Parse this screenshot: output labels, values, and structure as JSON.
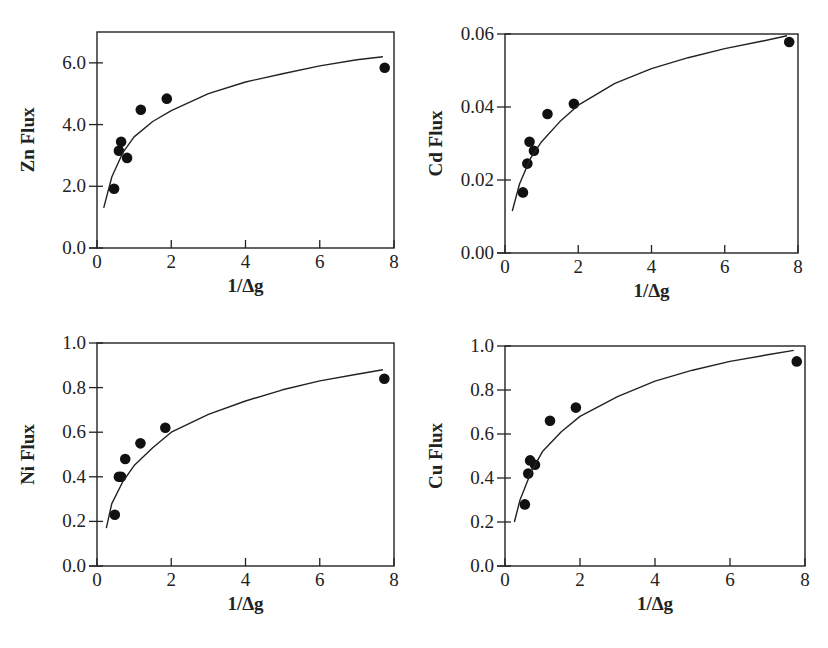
{
  "chart_data": [
    {
      "type": "scatter",
      "panel": "top-left",
      "title": "",
      "xlabel": "1/Δg",
      "ylabel": "Zn  Flux",
      "xlim": [
        0,
        8
      ],
      "ylim": [
        0,
        7
      ],
      "x_ticks": [
        "0",
        "2",
        "4",
        "6",
        "8"
      ],
      "y_ticks": [
        "0.0",
        "2.0",
        "4.0",
        "6.0"
      ],
      "grid": false,
      "legend": null,
      "series": [
        {
          "name": "observed",
          "kind": "points",
          "x": [
            0.46,
            0.59,
            0.65,
            0.81,
            1.18,
            1.88,
            7.75
          ],
          "y": [
            1.92,
            3.15,
            3.44,
            2.92,
            4.48,
            4.84,
            5.84
          ]
        },
        {
          "name": "fit",
          "kind": "line",
          "x": [
            0.18,
            0.4,
            0.7,
            1.0,
            1.5,
            2.0,
            3.0,
            4.0,
            5.0,
            6.0,
            7.0,
            7.7
          ],
          "y": [
            1.3,
            2.3,
            3.1,
            3.6,
            4.1,
            4.45,
            5.0,
            5.38,
            5.65,
            5.9,
            6.1,
            6.2
          ]
        }
      ]
    },
    {
      "type": "scatter",
      "panel": "top-right",
      "title": "",
      "xlabel": "1/Δg",
      "ylabel": "Cd Flux",
      "xlim": [
        0,
        8
      ],
      "ylim": [
        0,
        0.06
      ],
      "x_ticks": [
        "0",
        "2",
        "4",
        "6",
        "8"
      ],
      "y_ticks": [
        "0.00",
        "0.02",
        "0.04",
        "0.06"
      ],
      "grid": false,
      "legend": null,
      "series": [
        {
          "name": "observed",
          "kind": "points",
          "x": [
            0.49,
            0.61,
            0.67,
            0.79,
            1.16,
            1.88,
            7.76
          ],
          "y": [
            0.0166,
            0.0245,
            0.0305,
            0.028,
            0.0381,
            0.0409,
            0.0578
          ]
        },
        {
          "name": "fit",
          "kind": "line",
          "x": [
            0.2,
            0.4,
            0.7,
            1.0,
            1.5,
            2.0,
            3.0,
            4.0,
            5.0,
            6.0,
            7.0,
            7.7
          ],
          "y": [
            0.0115,
            0.019,
            0.026,
            0.0305,
            0.036,
            0.0405,
            0.0465,
            0.0505,
            0.0535,
            0.056,
            0.058,
            0.0595
          ]
        }
      ]
    },
    {
      "type": "scatter",
      "panel": "bottom-left",
      "title": "",
      "xlabel": "1/Δg",
      "ylabel": "Ni Flux",
      "xlim": [
        0,
        8
      ],
      "ylim": [
        0,
        1.0
      ],
      "x_ticks": [
        "0",
        "2",
        "4",
        "6",
        "8"
      ],
      "y_ticks": [
        "0.0",
        "0.2",
        "0.4",
        "0.6",
        "0.8",
        "1.0"
      ],
      "grid": false,
      "legend": null,
      "series": [
        {
          "name": "observed",
          "kind": "points",
          "x": [
            0.48,
            0.59,
            0.65,
            0.76,
            1.17,
            1.84,
            7.74
          ],
          "y": [
            0.23,
            0.4,
            0.4,
            0.48,
            0.55,
            0.62,
            0.84
          ]
        },
        {
          "name": "fit",
          "kind": "line",
          "x": [
            0.25,
            0.4,
            0.7,
            1.0,
            1.5,
            2.0,
            3.0,
            4.0,
            5.0,
            6.0,
            7.0,
            7.7
          ],
          "y": [
            0.17,
            0.28,
            0.38,
            0.45,
            0.53,
            0.6,
            0.68,
            0.74,
            0.79,
            0.83,
            0.86,
            0.88
          ]
        }
      ]
    },
    {
      "type": "scatter",
      "panel": "bottom-right",
      "title": "",
      "xlabel": "1/Δg",
      "ylabel": "Cu Flux",
      "xlim": [
        0,
        8
      ],
      "ylim": [
        0,
        1.0
      ],
      "x_ticks": [
        "0",
        "2",
        "4",
        "6",
        "8"
      ],
      "y_ticks": [
        "0.0",
        "0.2",
        "0.4",
        "0.6",
        "0.8",
        "1.0"
      ],
      "grid": false,
      "legend": null,
      "series": [
        {
          "name": "observed",
          "kind": "points",
          "x": [
            0.53,
            0.62,
            0.67,
            0.8,
            1.2,
            1.89,
            7.78
          ],
          "y": [
            0.28,
            0.42,
            0.48,
            0.46,
            0.66,
            0.72,
            0.93
          ]
        },
        {
          "name": "fit",
          "kind": "line",
          "x": [
            0.25,
            0.4,
            0.7,
            1.0,
            1.5,
            2.0,
            3.0,
            4.0,
            5.0,
            6.0,
            7.0,
            7.7
          ],
          "y": [
            0.2,
            0.3,
            0.43,
            0.52,
            0.61,
            0.68,
            0.77,
            0.84,
            0.89,
            0.93,
            0.96,
            0.98
          ]
        }
      ]
    }
  ],
  "panels": [
    {
      "id": "zn",
      "box": {
        "x0": 97,
        "y0": 32,
        "x1": 394,
        "y1": 248
      }
    },
    {
      "id": "cd",
      "box": {
        "x0": 505,
        "y0": 34,
        "x1": 798,
        "y1": 253
      }
    },
    {
      "id": "ni",
      "box": {
        "x0": 97,
        "y0": 343,
        "x1": 394,
        "y1": 566
      }
    },
    {
      "id": "cu",
      "box": {
        "x0": 505,
        "y0": 346,
        "x1": 805,
        "y1": 566
      }
    }
  ]
}
